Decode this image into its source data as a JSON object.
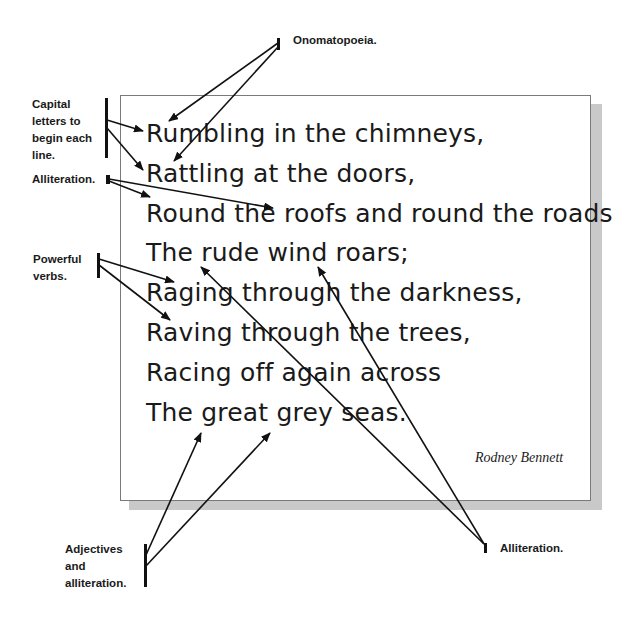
{
  "poem": {
    "lines": [
      "Rumbling in the chimneys,",
      "Rattling at the doors,",
      "Round the roofs and round the roads",
      "The rude wind roars;",
      "Raging through the darkness,",
      "Raving through the trees,",
      "Racing off again across",
      "The great grey seas."
    ],
    "author": "Rodney Bennett"
  },
  "annotations": {
    "onomatopoeia": "Onomatopoeia.",
    "capital_letters": "Capital\nletters to\nbegin each\nline.",
    "alliteration_top": "Alliteration.",
    "powerful_verbs": "Powerful\nverbs.",
    "adjectives": "Adjectives\nand\nalliteration.",
    "alliteration_bottom": "Alliteration."
  },
  "colors": {
    "ink": "#111111",
    "box_border": "#7a7a7a",
    "shadow": "#c9c9c9"
  }
}
